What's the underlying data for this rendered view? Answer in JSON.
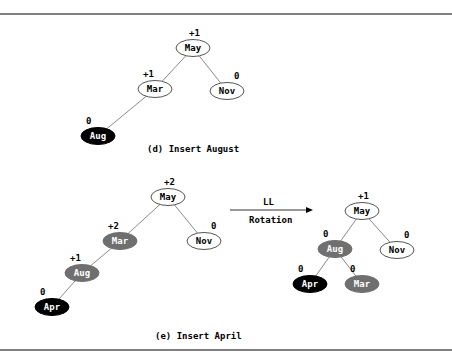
{
  "colors": {
    "white_node": "#ffffff",
    "gray_node": "#6f6f6f",
    "black_node": "#000000",
    "line": "#8a8a8a",
    "rule": "#555555"
  },
  "panel_d": {
    "caption": "(d) Insert August",
    "nodes": [
      {
        "id": "d-may",
        "label": "May",
        "balance": "+1",
        "fill": "white",
        "x": 193,
        "y": 48
      },
      {
        "id": "d-mar",
        "label": "Mar",
        "balance": "+1",
        "fill": "white",
        "x": 155,
        "y": 89
      },
      {
        "id": "d-nov",
        "label": "Nov",
        "balance": "0",
        "fill": "white",
        "x": 227,
        "y": 91
      },
      {
        "id": "d-aug",
        "label": "Aug",
        "balance": "0",
        "fill": "black",
        "x": 98,
        "y": 136
      }
    ],
    "edges": [
      [
        "d-may",
        "d-mar"
      ],
      [
        "d-may",
        "d-nov"
      ],
      [
        "d-mar",
        "d-aug"
      ]
    ]
  },
  "panel_e": {
    "caption": "(e) Insert April",
    "arrow": {
      "top_label": "LL",
      "bottom_label": "Rotation"
    },
    "before": {
      "nodes": [
        {
          "id": "e1-may",
          "label": "May",
          "balance": "+2",
          "fill": "white",
          "x": 168,
          "y": 197
        },
        {
          "id": "e1-mar",
          "label": "Mar",
          "balance": "+2",
          "fill": "gray",
          "x": 120,
          "y": 241
        },
        {
          "id": "e1-nov",
          "label": "Nov",
          "balance": "0",
          "fill": "white",
          "x": 204,
          "y": 241
        },
        {
          "id": "e1-aug",
          "label": "Aug",
          "balance": "+1",
          "fill": "gray",
          "x": 82,
          "y": 273
        },
        {
          "id": "e1-apr",
          "label": "Apr",
          "balance": "0",
          "fill": "black",
          "x": 52,
          "y": 307
        }
      ],
      "edges": [
        [
          "e1-may",
          "e1-mar"
        ],
        [
          "e1-may",
          "e1-nov"
        ],
        [
          "e1-mar",
          "e1-aug"
        ],
        [
          "e1-aug",
          "e1-apr"
        ]
      ]
    },
    "after": {
      "nodes": [
        {
          "id": "e2-may",
          "label": "May",
          "balance": "+1",
          "fill": "white",
          "x": 362,
          "y": 211
        },
        {
          "id": "e2-aug",
          "label": "Aug",
          "balance": "0",
          "fill": "gray",
          "x": 335,
          "y": 249
        },
        {
          "id": "e2-nov",
          "label": "Nov",
          "balance": "0",
          "fill": "white",
          "x": 397,
          "y": 250
        },
        {
          "id": "e2-apr",
          "label": "Apr",
          "balance": "0",
          "fill": "black",
          "x": 310,
          "y": 284
        },
        {
          "id": "e2-mar",
          "label": "Mar",
          "balance": "0",
          "fill": "gray",
          "x": 362,
          "y": 284
        }
      ],
      "edges": [
        [
          "e2-may",
          "e2-aug"
        ],
        [
          "e2-may",
          "e2-nov"
        ],
        [
          "e2-aug",
          "e2-apr"
        ],
        [
          "e2-aug",
          "e2-mar"
        ]
      ]
    }
  }
}
